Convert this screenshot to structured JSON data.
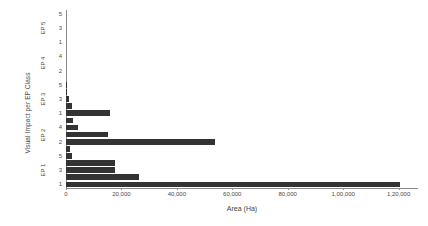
{
  "chart_data": {
    "type": "bar",
    "orientation": "horizontal",
    "title": "",
    "xlabel": "Area (Ha)",
    "ylabel": "Visual Impact per EP Class",
    "xlim": [
      0,
      127000
    ],
    "grid": false,
    "legend": null,
    "xticks": [
      {
        "value": 0,
        "label": "0"
      },
      {
        "value": 20000,
        "label": "20,000"
      },
      {
        "value": 40000,
        "label": "40,000"
      },
      {
        "value": 60000,
        "label": "60,000"
      },
      {
        "value": 80000,
        "label": "80,000"
      },
      {
        "value": 100000,
        "label": "1,00,000"
      },
      {
        "value": 120000,
        "label": "1,20,000"
      }
    ],
    "groups": [
      {
        "name": "EP 1",
        "label": "EP 1",
        "categories": [
          "1",
          "2",
          "3",
          "4",
          "5"
        ],
        "tick_labels": [
          "1",
          "",
          "3",
          "",
          "5"
        ],
        "values": [
          120500,
          26500,
          17800,
          17800,
          2100
        ]
      },
      {
        "name": "EP 2",
        "label": "EP 2",
        "categories": [
          "1",
          "2",
          "3",
          "4",
          "5"
        ],
        "tick_labels": [
          "",
          "2",
          "",
          "4",
          ""
        ],
        "values": [
          1400,
          53700,
          15100,
          4200,
          2400
        ]
      },
      {
        "name": "EP 3",
        "label": "EP 3",
        "categories": [
          "1",
          "2",
          "3",
          "4",
          "5"
        ],
        "tick_labels": [
          "1",
          "",
          "3",
          "",
          "5"
        ],
        "values": [
          16000,
          2300,
          1200,
          400,
          300
        ]
      },
      {
        "name": "EP 4",
        "label": "EP 4",
        "categories": [
          "1",
          "2",
          "3",
          "4",
          "5"
        ],
        "tick_labels": [
          "",
          "2",
          "",
          "4",
          ""
        ],
        "values": [
          0,
          0,
          0,
          0,
          0
        ]
      },
      {
        "name": "EP 5",
        "label": "EP 5",
        "categories": [
          "1",
          "2",
          "3",
          "4",
          "5"
        ],
        "tick_labels": [
          "1",
          "",
          "3",
          "",
          "5"
        ],
        "values": [
          0,
          0,
          0,
          0,
          0
        ]
      }
    ],
    "bar_color": "#333333",
    "axis_color": "#8a8a8a"
  }
}
